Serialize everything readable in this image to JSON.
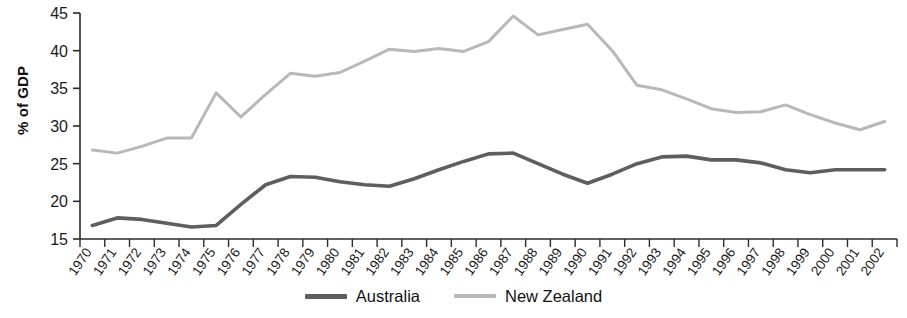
{
  "chart_data": {
    "type": "line",
    "title": "",
    "subtitle": "",
    "xlabel": "",
    "ylabel": "% of GDP",
    "ylim": [
      15,
      45
    ],
    "yticks": [
      15,
      20,
      25,
      30,
      35,
      40,
      45
    ],
    "grid": false,
    "legend_position": "bottom-center",
    "categories": [
      "1970",
      "1971",
      "1972",
      "1973",
      "1974",
      "1975",
      "1976",
      "1977",
      "1978",
      "1979",
      "1980",
      "1981",
      "1982",
      "1983",
      "1984",
      "1985",
      "1986",
      "1987",
      "1988",
      "1989",
      "1990",
      "1991",
      "1992",
      "1993",
      "1994",
      "1995",
      "1996",
      "1997",
      "1998",
      "1999",
      "2000",
      "2001",
      "2002"
    ],
    "series": [
      {
        "name": "Australia",
        "color": "#5e5e5e",
        "values": [
          16.8,
          17.8,
          17.6,
          17.1,
          16.6,
          16.8,
          19.6,
          22.2,
          23.3,
          23.2,
          22.6,
          22.2,
          22.0,
          23.0,
          24.2,
          25.3,
          26.3,
          26.4,
          25.0,
          23.6,
          22.4,
          23.6,
          25.0,
          25.9,
          26.0,
          25.5,
          25.5,
          25.1,
          24.2,
          23.8,
          24.2,
          24.2,
          24.2
        ]
      },
      {
        "name": "New Zealand",
        "color": "#b8b8b8",
        "values": [
          26.8,
          26.4,
          27.3,
          28.4,
          28.4,
          34.4,
          31.2,
          34.2,
          37.0,
          36.6,
          37.1,
          38.6,
          40.2,
          39.9,
          40.3,
          39.9,
          41.2,
          44.6,
          42.1,
          42.8,
          43.5,
          40.0,
          35.4,
          34.8,
          33.6,
          32.3,
          31.8,
          31.9,
          32.8,
          31.5,
          30.4,
          29.5,
          30.6
        ]
      }
    ]
  },
  "legend": {
    "entries": [
      {
        "label": "Australia",
        "color": "#5e5e5e"
      },
      {
        "label": "New Zealand",
        "color": "#b8b8b8"
      }
    ]
  }
}
